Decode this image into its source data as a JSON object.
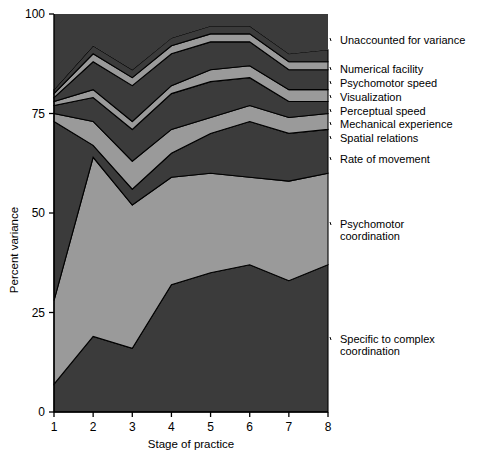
{
  "figure": {
    "background": "#ffffff",
    "plot": {
      "left": 54,
      "top": 14,
      "right": 328,
      "bottom": 412
    }
  },
  "axes": {
    "y": {
      "title": "Percent variance",
      "ticks": [
        "0",
        "25",
        "50",
        "75",
        "100"
      ],
      "values": [
        0,
        25,
        50,
        75,
        100
      ],
      "min": 0,
      "max": 100
    },
    "x": {
      "title": "Stage of practice",
      "ticks": [
        "1",
        "2",
        "3",
        "4",
        "5",
        "6",
        "7",
        "8"
      ],
      "values": [
        1,
        2,
        3,
        4,
        5,
        6,
        7,
        8
      ],
      "min": 1,
      "max": 8
    }
  },
  "palette": {
    "dark": "#3b3b3b",
    "light": "#9a9a9a",
    "outline": "#000000"
  },
  "legend": {
    "position": "right",
    "entries": [
      {
        "label": "Unaccounted for variance",
        "color": "#3b3b3b",
        "y": 44
      },
      {
        "label": "Numerical facility",
        "color": "#9a9a9a",
        "y": 73
      },
      {
        "label": "Psychomotor speed",
        "color": "#3b3b3b",
        "y": 87
      },
      {
        "label": "Visualization",
        "color": "#9a9a9a",
        "y": 101
      },
      {
        "label": "Perceptual speed",
        "color": "#3b3b3b",
        "y": 115
      },
      {
        "label": "Mechanical experience",
        "color": "#9a9a9a",
        "y": 128
      },
      {
        "label": "Spatial relations",
        "color": "#3b3b3b",
        "y": 142
      },
      {
        "label": "Rate of movement",
        "color": "#9a9a9a",
        "y": 163
      },
      {
        "label": "Psychomotor coordination",
        "color": "#9a9a9a",
        "y": 228
      },
      {
        "label": "Specific to complex coordination",
        "color": "#3b3b3b",
        "y": 343
      }
    ]
  },
  "chart_data": {
    "type": "area",
    "title": "",
    "xlabel": "Stage of practice",
    "ylabel": "Percent variance",
    "xlim": [
      1,
      8
    ],
    "ylim": [
      0,
      100
    ],
    "grid": false,
    "stacked": true,
    "legend_position": "right",
    "categories": [
      "1",
      "2",
      "3",
      "4",
      "5",
      "6",
      "7",
      "8"
    ],
    "x": [
      1,
      2,
      3,
      4,
      5,
      6,
      7,
      8
    ],
    "series": [
      {
        "name": "Specific to complex coordination",
        "color": "#3b3b3b",
        "values": [
          7,
          19,
          16,
          32,
          35,
          37,
          33,
          37
        ]
      },
      {
        "name": "Psychomotor coordination",
        "color": "#9a9a9a",
        "values": [
          21,
          45,
          36,
          27,
          25,
          22,
          25,
          23
        ]
      },
      {
        "name": "Rate of movement",
        "color": "#3b3b3b",
        "values": [
          45,
          3,
          4,
          6,
          10,
          14,
          12,
          11
        ]
      },
      {
        "name": "Spatial relations",
        "color": "#9a9a9a",
        "values": [
          2,
          6,
          7,
          6,
          4,
          4,
          4,
          4
        ]
      },
      {
        "name": "Mechanical experience",
        "color": "#3b3b3b",
        "values": [
          2,
          6,
          8,
          9,
          9,
          7,
          4,
          3
        ]
      },
      {
        "name": "Perceptual speed",
        "color": "#9a9a9a",
        "values": [
          1,
          2,
          2,
          2,
          3,
          3,
          3,
          3
        ]
      },
      {
        "name": "Visualization",
        "color": "#3b3b3b",
        "values": [
          1,
          7,
          9,
          8,
          7,
          6,
          5,
          5
        ]
      },
      {
        "name": "Psychomotor speed",
        "color": "#9a9a9a",
        "values": [
          1,
          2,
          2,
          2,
          2,
          2,
          2,
          2
        ]
      },
      {
        "name": "Numerical facility",
        "color": "#3b3b3b",
        "values": [
          1,
          2,
          2,
          2,
          2,
          2,
          2,
          3
        ]
      },
      {
        "name": "Unaccounted for variance",
        "color": "#3b3b3b",
        "values": [
          19,
          8,
          14,
          6,
          3,
          3,
          10,
          9
        ]
      }
    ],
    "cumulative_tops": [
      {
        "name": "Specific to complex coordination",
        "values": [
          7,
          19,
          16,
          32,
          35,
          37,
          33,
          37
        ]
      },
      {
        "name": "Psychomotor coordination",
        "values": [
          28,
          64,
          52,
          59,
          60,
          59,
          58,
          60
        ]
      },
      {
        "name": "Rate of movement",
        "values": [
          73,
          67,
          56,
          65,
          70,
          73,
          70,
          71
        ]
      },
      {
        "name": "Spatial relations",
        "values": [
          75,
          73,
          63,
          71,
          74,
          77,
          74,
          75
        ]
      },
      {
        "name": "Mechanical experience",
        "values": [
          77,
          79,
          71,
          80,
          83,
          84,
          78,
          78
        ]
      },
      {
        "name": "Perceptual speed",
        "values": [
          78,
          81,
          73,
          82,
          86,
          87,
          81,
          81
        ]
      },
      {
        "name": "Visualization",
        "values": [
          79,
          88,
          82,
          90,
          93,
          93,
          86,
          86
        ]
      },
      {
        "name": "Psychomotor speed",
        "values": [
          80,
          90,
          84,
          92,
          95,
          95,
          88,
          88
        ]
      },
      {
        "name": "Numerical facility",
        "values": [
          81,
          92,
          86,
          94,
          97,
          97,
          90,
          91
        ]
      },
      {
        "name": "Unaccounted for variance",
        "values": [
          100,
          100,
          100,
          100,
          100,
          100,
          100,
          100
        ]
      }
    ]
  }
}
